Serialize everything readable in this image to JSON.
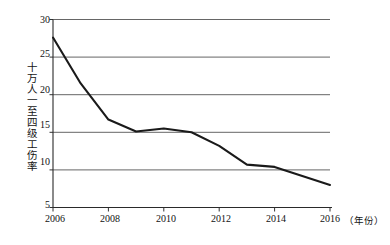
{
  "chart_data": {
    "type": "line",
    "title": "",
    "subtitle": "",
    "xlabel": "年份",
    "ylabel": "十万人一至四级工伤率",
    "x": [
      2006,
      2007,
      2008,
      2009,
      2010,
      2011,
      2012,
      2013,
      2014,
      2015,
      2016
    ],
    "values": [
      27.6,
      21.5,
      16.7,
      15.1,
      15.5,
      15.0,
      13.2,
      10.7,
      10.4,
      9.2,
      8.0
    ],
    "series": [
      {
        "name": "十万人一至四级工伤率",
        "values": [
          27.6,
          21.5,
          16.7,
          15.1,
          15.5,
          15.0,
          13.2,
          10.7,
          10.4,
          9.2,
          8.0
        ]
      }
    ],
    "xlim": [
      2006,
      2016
    ],
    "ylim": [
      5,
      30
    ],
    "x_tick_labels": [
      "2006",
      "2008",
      "2010",
      "2012",
      "2014",
      "2016"
    ],
    "x_tick_values": [
      2006,
      2008,
      2010,
      2012,
      2014,
      2016
    ],
    "y_tick_labels": [
      "5",
      "10",
      "15",
      "20",
      "25",
      "30"
    ],
    "y_tick_values": [
      5,
      10,
      15,
      20,
      25,
      30
    ],
    "grid": true,
    "grid_orientation": "horizontal",
    "legend": false,
    "legend_position": "none",
    "line_color": "#1a1a1a",
    "grid_color": "#555555",
    "axis_color": "#333333",
    "background_color": "#ffffff"
  },
  "axes": {
    "y_title": "十万人一至四级工伤率",
    "x_unit_label": "（年份）",
    "y_ticks": [
      {
        "label": "30",
        "value": 30
      },
      {
        "label": "25",
        "value": 25
      },
      {
        "label": "20",
        "value": 20
      },
      {
        "label": "15",
        "value": 15
      },
      {
        "label": "10",
        "value": 10
      },
      {
        "label": "5",
        "value": 5
      }
    ],
    "x_ticks": [
      {
        "label": "2006",
        "value": 2006
      },
      {
        "label": "2008",
        "value": 2008
      },
      {
        "label": "2010",
        "value": 2010
      },
      {
        "label": "2012",
        "value": 2012
      },
      {
        "label": "2014",
        "value": 2014
      },
      {
        "label": "2016",
        "value": 2016
      }
    ]
  }
}
